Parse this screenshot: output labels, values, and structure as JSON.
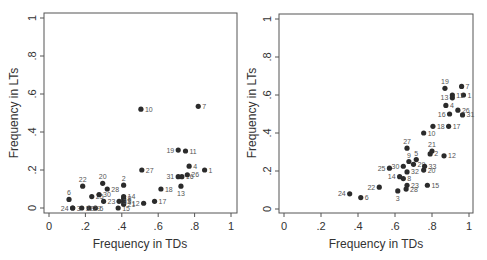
{
  "chart_data": [
    {
      "type": "scatter",
      "title": "",
      "xlabel": "Frequency in TDs",
      "ylabel": "Frequency in LTs",
      "xlim": [
        0,
        1
      ],
      "ylim": [
        0,
        1
      ],
      "xticks": [
        "0",
        ".2",
        ".4",
        ".6",
        ".8",
        "1"
      ],
      "yticks": [
        "0",
        ".2",
        ".4",
        ".6",
        ".8",
        "1"
      ],
      "grid": false,
      "legend": "none",
      "marker_color": "#2b2b2b",
      "points": [
        {
          "label": "1",
          "x": 0.855,
          "y": 0.2
        },
        {
          "label": "2",
          "x": 0.41,
          "y": 0.12
        },
        {
          "label": "3",
          "x": 0.13,
          "y": 0.0
        },
        {
          "label": "4",
          "x": 0.77,
          "y": 0.22
        },
        {
          "label": "5",
          "x": 0.255,
          "y": 0.0
        },
        {
          "label": "6",
          "x": 0.11,
          "y": 0.045
        },
        {
          "label": "7",
          "x": 0.82,
          "y": 0.535
        },
        {
          "label": "8",
          "x": 0.41,
          "y": 0.05
        },
        {
          "label": "9",
          "x": 0.41,
          "y": 0.035
        },
        {
          "label": "10",
          "x": 0.505,
          "y": 0.52
        },
        {
          "label": "11",
          "x": 0.75,
          "y": 0.3
        },
        {
          "label": "12",
          "x": 0.52,
          "y": 0.025
        },
        {
          "label": "13",
          "x": 0.725,
          "y": 0.115
        },
        {
          "label": "14",
          "x": 0.41,
          "y": 0.06
        },
        {
          "label": "15",
          "x": 0.38,
          "y": 0.0
        },
        {
          "label": "16",
          "x": 0.73,
          "y": 0.165
        },
        {
          "label": "17",
          "x": 0.58,
          "y": 0.035
        },
        {
          "label": "18",
          "x": 0.615,
          "y": 0.1
        },
        {
          "label": "19",
          "x": 0.71,
          "y": 0.305
        },
        {
          "label": "20",
          "x": 0.295,
          "y": 0.13
        },
        {
          "label": "21",
          "x": 0.41,
          "y": 0.02
        },
        {
          "label": "22",
          "x": 0.185,
          "y": 0.115
        },
        {
          "label": "23",
          "x": 0.3,
          "y": 0.035
        },
        {
          "label": "24",
          "x": 0.13,
          "y": 0.0
        },
        {
          "label": "25",
          "x": 0.235,
          "y": 0.06
        },
        {
          "label": "26",
          "x": 0.76,
          "y": 0.175
        },
        {
          "label": "27",
          "x": 0.51,
          "y": 0.2
        },
        {
          "label": "28",
          "x": 0.32,
          "y": 0.1
        },
        {
          "label": "29",
          "x": 0.22,
          "y": 0.0
        },
        {
          "label": "30",
          "x": 0.275,
          "y": 0.07
        },
        {
          "label": "31",
          "x": 0.71,
          "y": 0.165
        },
        {
          "label": "32",
          "x": 0.18,
          "y": 0.0
        },
        {
          "label": "33",
          "x": 0.385,
          "y": 0.035
        }
      ]
    },
    {
      "type": "scatter",
      "title": "",
      "xlabel": "Frequency in TDs",
      "ylabel": "Frequency in LTs",
      "xlim": [
        0,
        1
      ],
      "ylim": [
        0,
        1
      ],
      "xticks": [
        "0",
        ".2",
        ".4",
        ".6",
        ".8",
        "1"
      ],
      "yticks": [
        "0",
        ".2",
        ".4",
        ".6",
        ".8",
        "1"
      ],
      "grid": false,
      "legend": "none",
      "marker_color": "#2b2b2b",
      "points": [
        {
          "label": "1",
          "x": 0.97,
          "y": 0.6
        },
        {
          "label": "2",
          "x": 0.79,
          "y": 0.29
        },
        {
          "label": "3",
          "x": 0.615,
          "y": 0.095
        },
        {
          "label": "4",
          "x": 0.875,
          "y": 0.545
        },
        {
          "label": "5",
          "x": 0.715,
          "y": 0.26
        },
        {
          "label": "6",
          "x": 0.415,
          "y": 0.06
        },
        {
          "label": "7",
          "x": 0.96,
          "y": 0.645
        },
        {
          "label": "8",
          "x": 0.645,
          "y": 0.16
        },
        {
          "label": "9",
          "x": 0.675,
          "y": 0.25
        },
        {
          "label": "10",
          "x": 0.755,
          "y": 0.4
        },
        {
          "label": "11",
          "x": 0.91,
          "y": 0.6
        },
        {
          "label": "12",
          "x": 0.865,
          "y": 0.28
        },
        {
          "label": "13",
          "x": 0.91,
          "y": 0.585
        },
        {
          "label": "14",
          "x": 0.625,
          "y": 0.17
        },
        {
          "label": "15",
          "x": 0.775,
          "y": 0.125
        },
        {
          "label": "16",
          "x": 0.895,
          "y": 0.5
        },
        {
          "label": "17",
          "x": 0.89,
          "y": 0.435
        },
        {
          "label": "18",
          "x": 0.805,
          "y": 0.435
        },
        {
          "label": "19",
          "x": 0.87,
          "y": 0.635
        },
        {
          "label": "20",
          "x": 0.755,
          "y": 0.205
        },
        {
          "label": "21",
          "x": 0.8,
          "y": 0.305
        },
        {
          "label": "22",
          "x": 0.515,
          "y": 0.115
        },
        {
          "label": "23",
          "x": 0.665,
          "y": 0.125
        },
        {
          "label": "24",
          "x": 0.355,
          "y": 0.08
        },
        {
          "label": "25",
          "x": 0.57,
          "y": 0.215
        },
        {
          "label": "26",
          "x": 0.94,
          "y": 0.52
        },
        {
          "label": "27",
          "x": 0.665,
          "y": 0.32
        },
        {
          "label": "28",
          "x": 0.66,
          "y": 0.105
        },
        {
          "label": "29",
          "x": 0.7,
          "y": 0.235
        },
        {
          "label": "30",
          "x": 0.645,
          "y": 0.225
        },
        {
          "label": "31",
          "x": 0.965,
          "y": 0.495
        },
        {
          "label": "32",
          "x": 0.665,
          "y": 0.195
        },
        {
          "label": "33",
          "x": 0.76,
          "y": 0.225
        }
      ]
    }
  ],
  "panels": [
    {
      "xlabel": "Frequency in TDs",
      "ylabel": "Frequency in LTs"
    },
    {
      "xlabel": "Frequency in TDs",
      "ylabel": "Frequency in LTs"
    }
  ],
  "style": {
    "marker_color": "#2b2b2b",
    "axis_color": "#555555",
    "text_color": "#333333",
    "label_color": "#555555"
  }
}
